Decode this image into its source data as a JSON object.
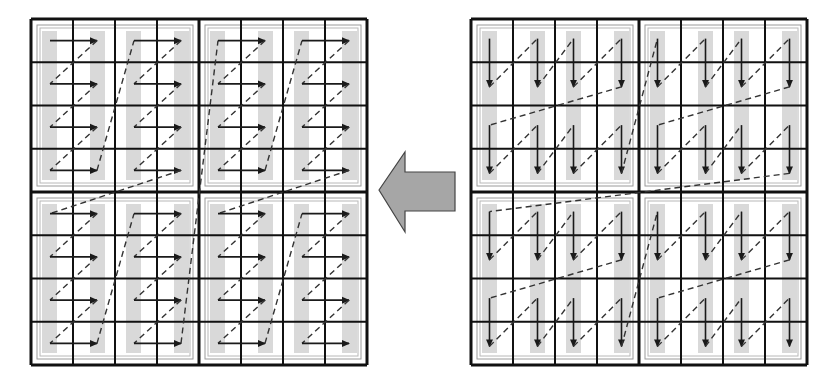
{
  "figure": {
    "title": "Block-wise scan order transformation: column-pair vertical scan (right) converted to row-pair horizontal scan (left)",
    "width": 837,
    "height": 388
  },
  "colors": {
    "background": "#ffffff",
    "grid_line": "#111111",
    "block_frame_outer": "#9a9a9a",
    "block_frame_inner": "#b8b8b8",
    "shade_bar": "#d9d9d9",
    "arrow": "#1a1a1a",
    "dashed_path": "#333333",
    "big_arrow_fill": "#a6a6a6",
    "big_arrow_stroke": "#444444"
  },
  "left_grid": {
    "name": "horizontal-scan-grid",
    "x": 31,
    "y": 19,
    "width": 336,
    "height": 346,
    "cols": 8,
    "rows": 8,
    "block_cols": 2,
    "block_rows": 2,
    "arrow_direction": "right",
    "block_order": [
      "top-left",
      "bottom-left",
      "top-right",
      "bottom-right"
    ],
    "description": "Each 4x4 block: horizontal arrows pair columns (0→1, 2→3) per row; dashed lines link row ends to next row starts"
  },
  "right_grid": {
    "name": "vertical-scan-grid",
    "x": 471,
    "y": 19,
    "width": 336,
    "height": 346,
    "cols": 8,
    "rows": 8,
    "block_cols": 2,
    "block_rows": 2,
    "arrow_direction": "down",
    "block_order": [
      "top-left",
      "top-right",
      "bottom-left",
      "bottom-right"
    ],
    "description": "Each 4x4 block: vertical arrows pair rows (0→1, 2→3) per column; dashed lines link column ends to next column starts"
  },
  "center_arrow": {
    "name": "conversion-arrow",
    "direction": "left",
    "points": "379,190 405,152 405,172 455,172 455,211 405,211 405,232"
  }
}
